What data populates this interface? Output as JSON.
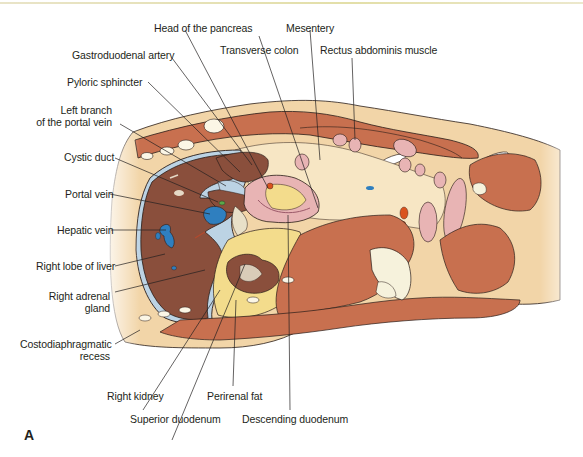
{
  "figure": {
    "panel_letter": "A",
    "accent_colors": {
      "liver": "#8a4f3c",
      "muscle": "#c8704f",
      "fat": "#f2d5a8",
      "fat_yellow": "#f3dc8c",
      "vein_blue": "#2f7fbf",
      "duct_light_blue": "#bcd3e4",
      "intestine_pink": "#e8b4b4",
      "bone": "#f6f2dc",
      "artery_orange": "#d9531e",
      "outline": "#2a1d18"
    }
  },
  "labels": {
    "head_of_pancreas": "Head of the pancreas",
    "mesentery": "Mesentery",
    "gastroduodenal_artery": "Gastroduodenal artery",
    "transverse_colon": "Transverse colon",
    "rectus_abdominis": "Rectus abdominis muscle",
    "pyloric_sphincter": "Pyloric sphincter",
    "left_branch_portal_line1": "Left branch",
    "left_branch_portal_line2": "of the portal vein",
    "cystic_duct": "Cystic duct",
    "portal_vein": "Portal vein",
    "hepatic_vein": "Hepatic vein",
    "right_lobe_liver": "Right lobe of liver",
    "right_adrenal_line1": "Right adrenal",
    "right_adrenal_line2": "gland",
    "costodiaphragmatic_line1": "Costodiaphragmatic",
    "costodiaphragmatic_line2": "recess",
    "right_kidney": "Right kidney",
    "perirenal_fat": "Perirenal fat",
    "superior_duodenum": "Superior duodenum",
    "descending_duodenum": "Descending duodenum"
  }
}
